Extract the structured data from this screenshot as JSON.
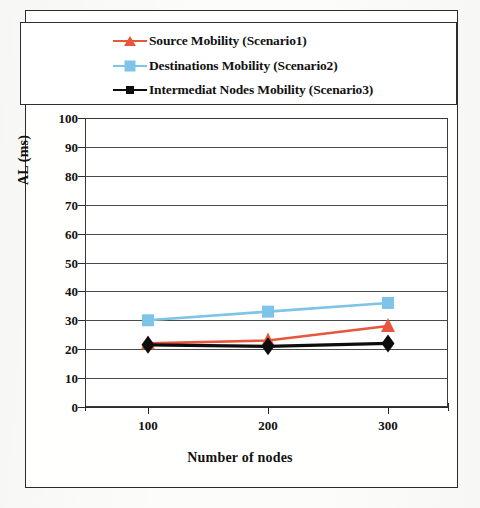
{
  "chart_data": {
    "type": "line",
    "title": "",
    "xlabel": "Number of nodes",
    "ylabel": "AL (ms)",
    "x": [
      100,
      200,
      300
    ],
    "categories": [
      "100",
      "200",
      "300"
    ],
    "xtick_labels": [
      "100",
      "200",
      "300"
    ],
    "ytick_labels": [
      "100",
      "90",
      "80",
      "70",
      "60",
      "50",
      "40",
      "30",
      "20",
      "10",
      "0"
    ],
    "ylim": [
      0,
      100
    ],
    "ytick_step": 10,
    "grid": true,
    "grid_axis": "y",
    "legend_position": "top",
    "series": [
      {
        "name": "Source Mobility (Scenario1)",
        "values": [
          22,
          23,
          28
        ],
        "color": "#e8563c",
        "marker": "triangle"
      },
      {
        "name": "Destinations  Mobility (Scenario2)",
        "values": [
          30,
          33,
          36
        ],
        "color": "#7ec3e8",
        "marker": "square"
      },
      {
        "name": "Intermediat Nodes  Mobility (Scenario3)",
        "values": [
          21.5,
          21,
          22
        ],
        "color": "#0d0d0d",
        "marker": "diamond"
      }
    ]
  },
  "legend": {
    "items": [
      {
        "label": "Source Mobility (Scenario1)",
        "marker": "triangle-marker",
        "color": "#e8563c"
      },
      {
        "label": "Destinations  Mobility (Scenario2)",
        "marker": "square-marker",
        "color": "#7ec3e8"
      },
      {
        "label": "Intermediat Nodes  Mobility (Scenario3)",
        "marker": "diamond-marker",
        "color": "#0d0d0d"
      }
    ]
  },
  "axes": {
    "y_title": "AL (ms)",
    "x_title": "Number of nodes",
    "y_ticks": [
      "100",
      "90",
      "80",
      "70",
      "60",
      "50",
      "40",
      "30",
      "20",
      "10",
      "0"
    ],
    "x_ticks": [
      "100",
      "200",
      "300"
    ]
  }
}
